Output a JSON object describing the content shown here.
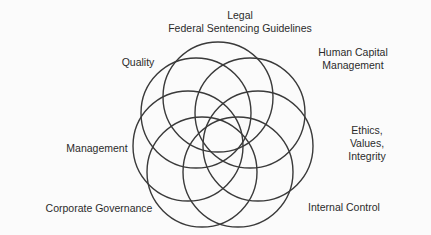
{
  "diagram": {
    "type": "overlapping-circles (rosette / Venn-style)",
    "circle_count": 7,
    "stroke_color": "#3a3a3a",
    "background_color": "#fbfbfb",
    "labels": {
      "legal": {
        "line1": "Legal",
        "line2": "Federal Sentencing Guidelines"
      },
      "quality": {
        "line1": "Quality"
      },
      "human_capital": {
        "line1": "Human Capital",
        "line2": "Management"
      },
      "management": {
        "line1": "Management"
      },
      "ethics": {
        "line1": "Ethics,",
        "line2": "Values,",
        "line3": "Integrity"
      },
      "corporate_governance": {
        "line1": "Corporate Governance"
      },
      "internal_control": {
        "line1": "Internal Control"
      }
    }
  }
}
